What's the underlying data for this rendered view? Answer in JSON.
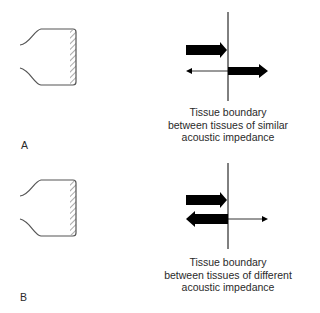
{
  "panels": [
    {
      "label": "A",
      "caption_lines": [
        "Tissue boundary",
        "between tissues of similar",
        "acoustic impedance"
      ]
    },
    {
      "label": "B",
      "caption_lines": [
        "Tissue boundary",
        "between tissues of different",
        "acoustic impedance"
      ]
    }
  ],
  "colors": {
    "line": "#555555",
    "arrow": "#000000",
    "text": "#2a2a2a"
  }
}
